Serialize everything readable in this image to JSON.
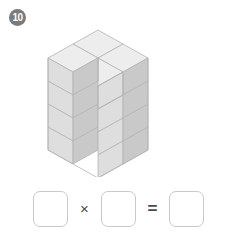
{
  "problem": {
    "number": "10",
    "badge_color": "#7b7b7b"
  },
  "figure": {
    "name": "isometric-cube-stack",
    "layers": 4,
    "cubes_per_layer": 3,
    "total_cubes": 12,
    "colors": {
      "top_face": "#ededed",
      "left_face": "#dedede",
      "right_face": "#c9c9c9",
      "outline": "#b4b4b4"
    }
  },
  "equation": {
    "factor1": "",
    "factor2": "",
    "product": "",
    "multiply_symbol": "×",
    "equals_symbol": "=",
    "placeholder": ""
  }
}
